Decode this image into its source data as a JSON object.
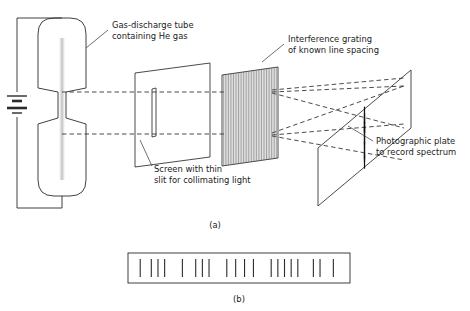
{
  "figure": {
    "title_absent": true,
    "panels": [
      {
        "id": "a",
        "label": "(a)",
        "x": 215,
        "y": 228
      },
      {
        "id": "b",
        "label": "(b)",
        "x": 239,
        "y": 302
      }
    ],
    "annotations": [
      {
        "name": "gas-discharge-tube-label",
        "lines": [
          "Gas-discharge tube",
          "containing He gas"
        ],
        "text_x": 112,
        "text_y": 28,
        "leader": {
          "x1": 108,
          "y1": 30,
          "x2": 86,
          "y2": 48
        }
      },
      {
        "name": "interference-grating-label",
        "lines": [
          "Interference grating",
          "of known line spacing"
        ],
        "text_x": 288,
        "text_y": 42,
        "leader": {
          "x1": 284,
          "y1": 44,
          "x2": 262,
          "y2": 62
        }
      },
      {
        "name": "collimating-slit-label",
        "lines": [
          "Screen with thin",
          "slit for collimating light"
        ],
        "text_x": 154,
        "text_y": 172,
        "leader": {
          "x1": 152,
          "y1": 166,
          "x2": 140,
          "y2": 140
        }
      },
      {
        "name": "photographic-plate-label",
        "lines": [
          "Photographic plate",
          "to record spectrum"
        ],
        "text_x": 376,
        "text_y": 144,
        "leader": {
          "x1": 373,
          "y1": 141,
          "x2": 348,
          "y2": 126
        }
      }
    ],
    "discharge_tube": {
      "name": "gas-discharge-tube",
      "gas": "He",
      "upper_bulb": {
        "cx": 62,
        "top": 18,
        "bottom": 92,
        "half_width": 24
      },
      "lower_bulb": {
        "cx": 62,
        "top": 118,
        "bottom": 196,
        "half_width": 24
      },
      "capillary": {
        "cx": 62,
        "top": 92,
        "bottom": 118,
        "half_width": 4
      }
    },
    "circuit": {
      "name": "battery-circuit",
      "left_x": 17,
      "top_y": 18,
      "bottom_y": 208,
      "battery_center_y": 105,
      "plates": [
        {
          "y": 96,
          "half": 10,
          "w": 1.4
        },
        {
          "y": 101,
          "half": 5,
          "w": 2.6
        },
        {
          "y": 108,
          "half": 10,
          "w": 2.6
        },
        {
          "y": 113,
          "half": 5,
          "w": 1.4
        }
      ]
    },
    "screen": {
      "name": "collimating-screen",
      "quad": "135,73 210,63 210,157 135,167",
      "slit": {
        "x1": 152,
        "y1": 89,
        "x2": 152,
        "y2": 137,
        "x3": 156,
        "y3": 88,
        "x4": 156,
        "y4": 136
      }
    },
    "grating": {
      "name": "interference-grating",
      "quad": "222,75 278,67 278,158 222,166",
      "line_count": 34
    },
    "plate": {
      "name": "photographic-plate",
      "quad": "318,148 411,70 411,128 318,206",
      "spectral_lines": [
        {
          "u": 0.08,
          "h": 14
        },
        {
          "u": 0.16,
          "h": 11
        },
        {
          "u": 0.27,
          "h": 16
        },
        {
          "u": 0.31,
          "h": 12
        },
        {
          "u": 0.35,
          "h": 15
        },
        {
          "u": 0.46,
          "h": 18
        },
        {
          "u": 0.58,
          "h": 13
        },
        {
          "u": 0.71,
          "h": 17
        },
        {
          "u": 0.8,
          "h": 12
        },
        {
          "u": 0.9,
          "h": 15
        }
      ]
    },
    "rays": [
      {
        "name": "ray-upper-source",
        "d": "M 62 92 L 152 92 L 225 92"
      },
      {
        "name": "ray-lower-source",
        "d": "M 62 134 L 152 134 L 225 134"
      },
      {
        "name": "ray-upper-to-plate-top",
        "d": "M 272 90 L 404 78"
      },
      {
        "name": "ray-upper-to-plate-mid",
        "d": "M 272 92 L 404 86"
      },
      {
        "name": "ray-upper-fan-down",
        "d": "M 272 93 L 404 128"
      },
      {
        "name": "ray-lower-fan-up",
        "d": "M 272 133 L 404 86"
      },
      {
        "name": "ray-lower-to-plate",
        "d": "M 272 135 L 404 124"
      },
      {
        "name": "ray-lower-fan-down",
        "d": "M 272 136 L 404 160"
      }
    ],
    "spectrum_strip": {
      "name": "spectrum-strip",
      "x": 128,
      "y": 253,
      "width": 222,
      "height": 30,
      "lines": [
        0.055,
        0.105,
        0.135,
        0.165,
        0.245,
        0.305,
        0.335,
        0.365,
        0.445,
        0.485,
        0.525,
        0.565,
        0.645,
        0.675,
        0.705,
        0.735,
        0.765,
        0.835,
        0.865,
        0.925
      ]
    },
    "colors": {
      "ink": "#2b2b2b",
      "label_text": "#1a1a1a",
      "grating_hatch": "#555555",
      "background": "#ffffff"
    }
  }
}
